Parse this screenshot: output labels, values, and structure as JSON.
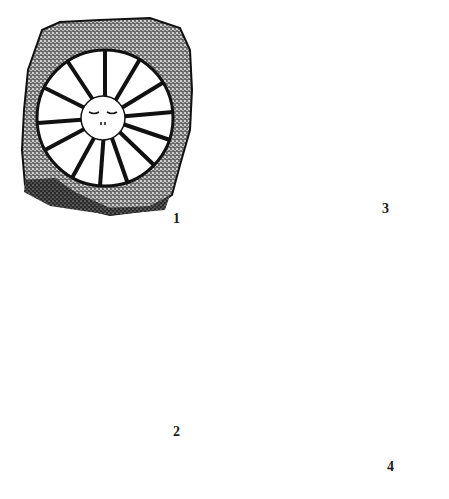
{
  "figure": {
    "colors": {
      "ink": "#151515",
      "paper": "#ffffff",
      "stipple_light": "#8a8a8a"
    },
    "panels": [
      {
        "id": 1,
        "label": "1",
        "subject": "sun disc with rays and face"
      },
      {
        "id": 2,
        "label": "2",
        "subject": "crab/insect-like figure with star"
      },
      {
        "id": 3,
        "label": "3",
        "subject": "stone with carved marks and curved groove"
      },
      {
        "id": 4,
        "label": "4",
        "subject": "stone with animal-like figure and cup marks"
      }
    ]
  }
}
